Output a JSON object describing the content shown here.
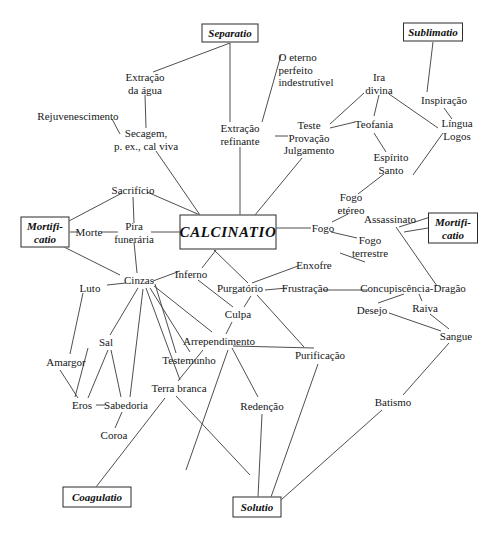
{
  "diagram": {
    "title": "CALCINATIO",
    "type": "concept-map",
    "language": "pt",
    "canvas": {
      "width": 490,
      "height": 533
    },
    "colors": {
      "ink": "#16181a",
      "stroke": "#3a3a3a",
      "background": "#ffffff"
    },
    "boxes": [
      {
        "id": "separatio",
        "label": "Separatio",
        "x": 230,
        "y": 33,
        "w": 57,
        "h": 19
      },
      {
        "id": "sublimatio",
        "label": "Sublimatio",
        "x": 433,
        "y": 32,
        "w": 60,
        "h": 19
      },
      {
        "id": "mortificatio_l",
        "label": "Mortifi-\ncatio",
        "x": 45,
        "y": 232,
        "w": 49,
        "h": 31
      },
      {
        "id": "mortificatio_r",
        "label": "Mortifi-\ncatio",
        "x": 453,
        "y": 228,
        "w": 50,
        "h": 31
      },
      {
        "id": "calcinatio",
        "label": "CALCINATIO",
        "x": 228,
        "y": 232,
        "w": 97,
        "h": 35
      },
      {
        "id": "coagulatio",
        "label": "Coagulatio",
        "x": 97,
        "y": 497,
        "w": 69,
        "h": 21
      },
      {
        "id": "solutio",
        "label": "Solutio",
        "x": 257,
        "y": 507,
        "w": 49,
        "h": 21
      }
    ],
    "nodes": [
      {
        "id": "extracao_agua",
        "label": "Extração\nda água",
        "x": 145,
        "y": 83
      },
      {
        "id": "rejuvenescimento",
        "label": "Rejuvenescimento",
        "x": 78,
        "y": 116
      },
      {
        "id": "secagem",
        "label": "Secagem,\np. ex., cal viva",
        "x": 146,
        "y": 139
      },
      {
        "id": "extracao_refinante",
        "label": "Extração\nrefinante",
        "x": 240,
        "y": 134
      },
      {
        "id": "eterno",
        "label": "O eterno\nperfeito\nindestrutível",
        "x": 306,
        "y": 70,
        "align": "left"
      },
      {
        "id": "teste",
        "label": "Teste\nProvação\nJulgamento",
        "x": 309,
        "y": 138
      },
      {
        "id": "ira_divina",
        "label": "Ira\ndivina",
        "x": 379,
        "y": 83
      },
      {
        "id": "inspiracao",
        "label": "Inspiração",
        "x": 444,
        "y": 100
      },
      {
        "id": "lingua_logos",
        "label": "Língua\nLogos",
        "x": 457,
        "y": 129
      },
      {
        "id": "teofania",
        "label": "Teofania",
        "x": 374,
        "y": 124
      },
      {
        "id": "espirito_santo",
        "label": "Espírito\nSanto",
        "x": 391,
        "y": 163
      },
      {
        "id": "fogo_etereo",
        "label": "Fogo\netéreo",
        "x": 351,
        "y": 203
      },
      {
        "id": "fogo",
        "label": "Fogo",
        "x": 323,
        "y": 228
      },
      {
        "id": "assassinato",
        "label": "Assassinato",
        "x": 390,
        "y": 219
      },
      {
        "id": "fogo_terrestre",
        "label": "Fogo\nterrestre",
        "x": 370,
        "y": 246
      },
      {
        "id": "enxofre",
        "label": "Enxofre",
        "x": 314,
        "y": 265
      },
      {
        "id": "sacrificio",
        "label": "Sacrifício",
        "x": 133,
        "y": 190
      },
      {
        "id": "morte",
        "label": "Morte",
        "x": 89,
        "y": 232
      },
      {
        "id": "pira",
        "label": "Pira\nfunerária",
        "x": 134,
        "y": 232
      },
      {
        "id": "inferno",
        "label": "Inferno",
        "x": 191,
        "y": 274
      },
      {
        "id": "cinzas",
        "label": "Cinzas",
        "x": 139,
        "y": 280
      },
      {
        "id": "luto",
        "label": "Luto",
        "x": 90,
        "y": 288
      },
      {
        "id": "purgatorio",
        "label": "Purgatório",
        "x": 240,
        "y": 288
      },
      {
        "id": "frustracao",
        "label": "Frustração",
        "x": 305,
        "y": 288
      },
      {
        "id": "concupiscencia",
        "label": "Concupiscência-Dragão",
        "x": 413,
        "y": 288
      },
      {
        "id": "culpa",
        "label": "Culpa",
        "x": 238,
        "y": 314
      },
      {
        "id": "desejo",
        "label": "Desejo",
        "x": 372,
        "y": 310
      },
      {
        "id": "raiva",
        "label": "Raiva",
        "x": 425,
        "y": 308
      },
      {
        "id": "sangue",
        "label": "Sangue",
        "x": 456,
        "y": 336
      },
      {
        "id": "sal",
        "label": "Sal",
        "x": 106,
        "y": 342
      },
      {
        "id": "arrependimento",
        "label": "Arrependimento",
        "x": 219,
        "y": 341
      },
      {
        "id": "testemunho",
        "label": "Testemunho",
        "x": 189,
        "y": 360
      },
      {
        "id": "amargor",
        "label": "Amargor",
        "x": 66,
        "y": 362
      },
      {
        "id": "purificacao",
        "label": "Purificação",
        "x": 320,
        "y": 355
      },
      {
        "id": "terra_branca",
        "label": "Terra branca",
        "x": 179,
        "y": 388
      },
      {
        "id": "eros",
        "label": "Eros",
        "x": 82,
        "y": 405
      },
      {
        "id": "sabedoria",
        "label": "Sabedoria",
        "x": 126,
        "y": 405
      },
      {
        "id": "batismo",
        "label": "Batismo",
        "x": 393,
        "y": 402
      },
      {
        "id": "redencao",
        "label": "Redenção",
        "x": 262,
        "y": 406
      },
      {
        "id": "coroa",
        "label": "Coroa",
        "x": 114,
        "y": 435
      }
    ],
    "edges": [
      [
        230,
        43,
        153,
        72
      ],
      [
        230,
        43,
        230,
        122
      ],
      [
        145,
        95,
        146,
        128
      ],
      [
        112,
        119,
        120,
        134
      ],
      [
        156,
        151,
        200,
        215
      ],
      [
        240,
        147,
        240,
        215
      ],
      [
        281,
        55,
        262,
        122
      ],
      [
        275,
        136,
        288,
        136
      ],
      [
        302,
        158,
        255,
        215
      ],
      [
        330,
        128,
        355,
        122
      ],
      [
        364,
        93,
        330,
        124
      ],
      [
        379,
        95,
        374,
        116
      ],
      [
        374,
        133,
        386,
        152
      ],
      [
        389,
        94,
        438,
        128
      ],
      [
        433,
        42,
        427,
        92
      ],
      [
        444,
        108,
        452,
        119
      ],
      [
        443,
        133,
        413,
        175
      ],
      [
        384,
        174,
        358,
        194
      ],
      [
        348,
        214,
        332,
        222
      ],
      [
        276,
        228,
        311,
        228
      ],
      [
        331,
        232,
        357,
        238
      ],
      [
        340,
        253,
        365,
        262
      ],
      [
        298,
        266,
        252,
        283
      ],
      [
        122,
        193,
        69,
        221
      ],
      [
        147,
        192,
        200,
        215
      ],
      [
        133,
        197,
        134,
        223
      ],
      [
        70,
        232,
        79,
        232
      ],
      [
        101,
        232,
        118,
        232
      ],
      [
        151,
        232,
        180,
        232
      ],
      [
        60,
        245,
        120,
        275
      ],
      [
        134,
        242,
        137,
        273
      ],
      [
        153,
        281,
        180,
        271
      ],
      [
        126,
        283,
        107,
        285
      ],
      [
        202,
        268,
        216,
        250
      ],
      [
        83,
        293,
        70,
        354
      ],
      [
        138,
        288,
        110,
        335
      ],
      [
        146,
        288,
        180,
        380
      ],
      [
        150,
        288,
        190,
        352
      ],
      [
        143,
        289,
        130,
        397
      ],
      [
        154,
        286,
        212,
        332
      ],
      [
        155,
        284,
        176,
        353
      ],
      [
        198,
        280,
        233,
        307
      ],
      [
        251,
        296,
        244,
        307
      ],
      [
        214,
        250,
        248,
        283
      ],
      [
        232,
        322,
        226,
        334
      ],
      [
        265,
        290,
        287,
        288
      ],
      [
        323,
        290,
        368,
        290
      ],
      [
        257,
        295,
        304,
        347
      ],
      [
        228,
        350,
        186,
        470
      ],
      [
        233,
        346,
        314,
        348
      ],
      [
        232,
        348,
        258,
        397
      ],
      [
        203,
        350,
        178,
        381
      ],
      [
        404,
        294,
        378,
        303
      ],
      [
        419,
        294,
        422,
        301
      ],
      [
        389,
        313,
        441,
        331
      ],
      [
        430,
        314,
        449,
        329
      ],
      [
        449,
        343,
        403,
        395
      ],
      [
        382,
        410,
        281,
        500
      ],
      [
        404,
        232,
        428,
        228
      ],
      [
        399,
        227,
        443,
        213
      ],
      [
        396,
        227,
        437,
        286
      ],
      [
        88,
        348,
        75,
        397
      ],
      [
        60,
        370,
        78,
        398
      ],
      [
        108,
        350,
        88,
        398
      ],
      [
        111,
        350,
        121,
        397
      ],
      [
        96,
        405,
        105,
        405
      ],
      [
        122,
        412,
        115,
        428
      ],
      [
        176,
        396,
        250,
        475
      ],
      [
        318,
        364,
        271,
        497
      ],
      [
        262,
        414,
        258,
        497
      ],
      [
        96,
        487,
        165,
        398
      ]
    ]
  }
}
